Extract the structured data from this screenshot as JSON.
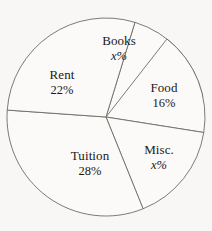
{
  "chart_data": {
    "type": "pie",
    "title": "",
    "subtitle": "",
    "xlabel": "",
    "ylabel": "",
    "grid": false,
    "legend": "none",
    "labels_position": "inside-slices",
    "total_percent": 100,
    "categories": [
      "Books",
      "Food",
      "Misc.",
      "Tuition",
      "Rent"
    ],
    "values": [
      17,
      16,
      17,
      28,
      22
    ],
    "value_labels": [
      "x%",
      "16%",
      "x%",
      "28%",
      "22%"
    ],
    "slices": [
      {
        "name": "Books",
        "label": "Books",
        "value_label": "x%",
        "value": 17,
        "known": false,
        "start_angle": -73,
        "end_angle": -12,
        "fill": "#fbfaf8"
      },
      {
        "name": "Food",
        "label": "Food",
        "value_label": "16%",
        "value": 16,
        "known": true,
        "start_angle": -52,
        "end_angle": 9,
        "fill": "#fbfaf8"
      },
      {
        "name": "Misc.",
        "label": "Misc.",
        "value_label": "x%",
        "value": 17,
        "known": false,
        "start_angle": 9,
        "end_angle": 68,
        "fill": "#fbfaf8"
      },
      {
        "name": "Tuition",
        "label": "Tuition",
        "value_label": "28%",
        "value": 28,
        "known": true,
        "start_angle": 68,
        "end_angle": 184,
        "fill": "#fbfaf8"
      },
      {
        "name": "Rent",
        "label": "Rent",
        "value_label": "22%",
        "value": 22,
        "known": true,
        "start_angle": 184,
        "end_angle": 287,
        "fill": "#fbfaf8"
      }
    ],
    "geometry": {
      "center_x": 106,
      "center_y": 117,
      "radius": 99
    },
    "colors": {
      "background": "#f8f7f5",
      "slice_fill": "#fbfaf8",
      "outline": "#6f6b66",
      "text": "#1b1917"
    }
  }
}
